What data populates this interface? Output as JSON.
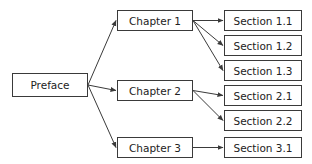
{
  "diagram": {
    "type": "tree",
    "direction": "left-to-right",
    "colors": {
      "stroke": "#3a3a3a",
      "text": "#222222",
      "background": "#ffffff"
    },
    "nodes": {
      "preface": {
        "label": "Preface",
        "x": 12,
        "y": 73,
        "w": 76,
        "h": 24
      },
      "chapter1": {
        "label": "Chapter 1",
        "x": 117,
        "y": 10,
        "w": 76,
        "h": 21
      },
      "chapter2": {
        "label": "Chapter 2",
        "x": 117,
        "y": 80,
        "w": 76,
        "h": 21
      },
      "chapter3": {
        "label": "Chapter 3",
        "x": 117,
        "y": 137,
        "w": 76,
        "h": 21
      },
      "section11": {
        "label": "Section 1.1",
        "x": 224,
        "y": 10,
        "w": 78,
        "h": 21
      },
      "section12": {
        "label": "Section 1.2",
        "x": 224,
        "y": 35,
        "w": 78,
        "h": 21
      },
      "section13": {
        "label": "Section 1.3",
        "x": 224,
        "y": 60,
        "w": 78,
        "h": 21
      },
      "section21": {
        "label": "Section 2.1",
        "x": 224,
        "y": 85,
        "w": 78,
        "h": 21
      },
      "section22": {
        "label": "Section 2.2",
        "x": 224,
        "y": 110,
        "w": 78,
        "h": 21
      },
      "section31": {
        "label": "Section 3.1",
        "x": 224,
        "y": 137,
        "w": 78,
        "h": 21
      }
    },
    "edges": [
      {
        "from": "preface",
        "to": "chapter1"
      },
      {
        "from": "preface",
        "to": "chapter2"
      },
      {
        "from": "preface",
        "to": "chapter3"
      },
      {
        "from": "chapter1",
        "to": "section11"
      },
      {
        "from": "chapter1",
        "to": "section12"
      },
      {
        "from": "chapter1",
        "to": "section13"
      },
      {
        "from": "chapter2",
        "to": "section21"
      },
      {
        "from": "chapter2",
        "to": "section22"
      },
      {
        "from": "chapter3",
        "to": "section31"
      }
    ]
  }
}
